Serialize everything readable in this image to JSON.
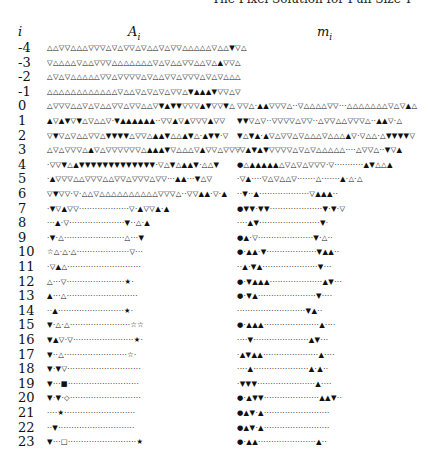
{
  "running_head": "The Pixel Solution for Full Size T",
  "columns": {
    "i": "i",
    "A": "A",
    "A_sub": "i",
    "m": "m",
    "m_sub": "i"
  },
  "symbol_key": {
    "a": "△",
    "v": "▽",
    "A": "▲",
    "V": "▼",
    ".": "·",
    "s": "☆",
    "S": "★",
    "o": "◇",
    "q": "□",
    "Q": "■",
    "O": "●"
  },
  "rows": [
    {
      "i": "-4",
      "A": "aavvaaavvvavavvavaavavvaaaaavaaVva",
      "m": ""
    },
    {
      "i": "-3",
      "A": "vaaaavaavvvaaaaaaavavaavvaavaAvva",
      "m": ""
    },
    {
      "i": "-2",
      "A": "avavaaaaavvavvvvavaavvavvvavavaaa",
      "m": ""
    },
    {
      "i": "-1",
      "A": "aaaaaaaaaaaavaavavavavvaVAAAVvvav",
      "m": ""
    },
    {
      "i": "0",
      "A": "avvvaavavaavvavvaavVAVVvvvAVvvVa",
      "m": "vva.AAvvva..vaaaavv...aaaaaaavavAa"
    },
    {
      "i": "1",
      "A": "AvAVvVavaav.VAAAAAA..vvAvAvvvAvv",
      "m": "VVvav..vvvvavv..avvaavvva..AAv.a"
    },
    {
      "i": "2",
      "A": "vVvavaavvaVVVVavvaAAVaaAVa.AVV.v",
      "m": "VaVA.AvavvavaaavaaaAv.vaa.aVVVVv"
    },
    {
      "i": "3",
      "A": "avavvvaAvavvvvvvaAAAVvaaavAvvavvv",
      "m": ".vAVAVvvvvavavaaaaa....avva..VvA"
    },
    {
      "i": "4",
      "A": ".vvVaAVVVVVVVVVVVVV.vaVaAAV.aaV",
      "m": "OaAAAAAavavavvv.v...........AVaaA"
    },
    {
      "i": "5",
      "A": ".Avvvaavvvaavvavvvavv...AA...Vav",
      "m": ".vA....vavaav.......a.......A.a.a"
    },
    {
      "i": "6",
      "A": "vVvv.v.aavaaaaaaaaaavvva..vvAA.v.A",
      "m": "..V..A...................vAAA.."
    },
    {
      "i": "7",
      "A": ".VvAvv...................v.AvvA.A",
      "m": "OVV.VV....................V.V.v"
    },
    {
      "i": "8",
      "A": "...A.v.....................V..a.A",
      "m": "....AV.......................V."
    },
    {
      "i": "9",
      "A": ".V.a.......................a...V",
      "m": "OA.v.....................V.a.."
    },
    {
      "i": "10",
      "A": "sa.a.a....................v...",
      "m": "O.AA.V...................VAA.."
    },
    {
      "i": "11",
      "A": ".vAa............................",
      "m": "..A.VA.....................V..."
    },
    {
      "i": "12",
      "A": "a...v......................S.",
      "m": "O.VAAA....................AV..."
    },
    {
      "i": "13",
      "A": "A...a...........................",
      "m": "O.VA......................V...."
    },
    {
      "i": "14",
      "A": "..A.........................S.",
      "m": "..........................VA.."
    },
    {
      "i": "15",
      "A": "V.a.a.......................ss",
      "m": "O.AAA.....................A...."
    },
    {
      "i": "16",
      "A": "VAv.v.......................S.",
      "m": "....V.....................AV..."
    },
    {
      "i": "17",
      "A": "V..a........................s.",
      "m": ".AVAA.....................A...."
    },
    {
      "i": "18",
      "A": "V.Vv............................",
      "m": "....A.....................A.A.."
    },
    {
      "i": "19",
      "A": "V...Q...........................",
      "m": ".VVV......................A...."
    },
    {
      "i": "20",
      "A": "V.V.o...........................",
      "m": "O.AVV.....................AAV.."
    },
    {
      "i": "21",
      "A": "....S...........................",
      "m": "OAV.A........................."
    },
    {
      "i": "22",
      "A": "..V.............................",
      "m": "OAV.A........................."
    },
    {
      "i": "23",
      "A": "V...q..........................S",
      "m": "O.AA......................A.."
    }
  ]
}
